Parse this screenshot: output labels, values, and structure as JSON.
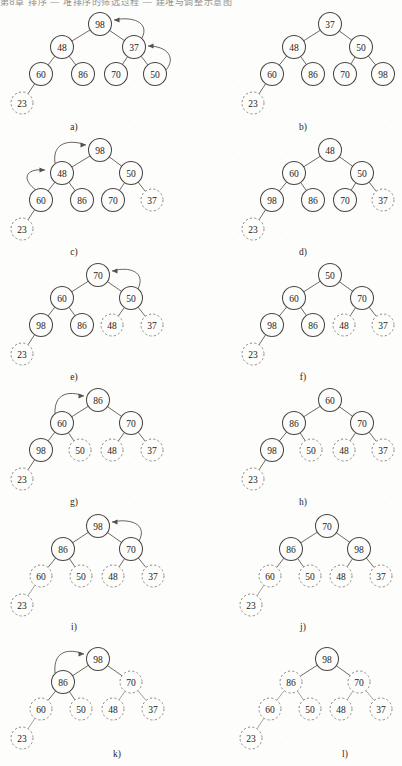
{
  "document": {
    "header_text": "第8章 排序 — 堆排序的筛选过程 — 建堆与调整示意图",
    "figure_type": "binary-tree-diagram-series",
    "node_radius_solid": 11.5,
    "node_radius_dashed": 11,
    "colors": {
      "page_background": "#fdfdfb",
      "solid_node_stroke": "#4a4744",
      "dashed_node_stroke": "#8d8a86",
      "edge_stroke": "#5d5a56",
      "arrow_stroke": "#55524e",
      "text": "#1d1a17"
    }
  },
  "panels": [
    {
      "id": "a",
      "caption": "a)",
      "root": "98",
      "nodes": [
        {
          "label": "98",
          "x": 100,
          "y": 24,
          "style": "solid"
        },
        {
          "label": "48",
          "x": 62,
          "y": 47,
          "style": "solid"
        },
        {
          "label": "37",
          "x": 134,
          "y": 47,
          "style": "solid"
        },
        {
          "label": "60",
          "x": 41,
          "y": 74,
          "style": "solid"
        },
        {
          "label": "86",
          "x": 83,
          "y": 74,
          "style": "solid"
        },
        {
          "label": "70",
          "x": 116,
          "y": 74,
          "style": "solid"
        },
        {
          "label": "50",
          "x": 155,
          "y": 74,
          "style": "solid"
        },
        {
          "label": "23",
          "x": 22,
          "y": 103,
          "style": "dashed"
        }
      ],
      "edges": [
        [
          0,
          1
        ],
        [
          0,
          2
        ],
        [
          1,
          3
        ],
        [
          1,
          4
        ],
        [
          2,
          5
        ],
        [
          2,
          6
        ],
        [
          3,
          7
        ]
      ],
      "arrows": [
        {
          "from": "50",
          "to": "37",
          "path": "M 166 70 C 176 58 168 46 148 46",
          "tip": [
            148,
            46
          ],
          "tip_dir": "left"
        },
        {
          "from": "37",
          "to": "98",
          "path": "M 142 38 C 150 22 132 16 114 20",
          "tip": [
            114,
            20
          ],
          "tip_dir": "left"
        }
      ]
    },
    {
      "id": "b",
      "caption": "b)",
      "root": "37",
      "nodes": [
        {
          "label": "37",
          "x": 330,
          "y": 24,
          "style": "solid"
        },
        {
          "label": "48",
          "x": 294,
          "y": 47,
          "style": "solid"
        },
        {
          "label": "50",
          "x": 361,
          "y": 47,
          "style": "solid"
        },
        {
          "label": "60",
          "x": 272,
          "y": 74,
          "style": "solid"
        },
        {
          "label": "86",
          "x": 313,
          "y": 74,
          "style": "solid"
        },
        {
          "label": "70",
          "x": 345,
          "y": 74,
          "style": "solid"
        },
        {
          "label": "98",
          "x": 383,
          "y": 74,
          "style": "solid"
        },
        {
          "label": "23",
          "x": 253,
          "y": 103,
          "style": "dashed"
        }
      ],
      "edges": [
        [
          0,
          1
        ],
        [
          0,
          2
        ],
        [
          1,
          3
        ],
        [
          1,
          4
        ],
        [
          2,
          5
        ],
        [
          2,
          6
        ],
        [
          3,
          7
        ]
      ],
      "arrows": []
    },
    {
      "id": "c",
      "caption": "c)",
      "root": "98",
      "nodes": [
        {
          "label": "98",
          "x": 100,
          "y": 150,
          "style": "solid"
        },
        {
          "label": "48",
          "x": 62,
          "y": 173,
          "style": "solid"
        },
        {
          "label": "50",
          "x": 131,
          "y": 173,
          "style": "solid"
        },
        {
          "label": "60",
          "x": 41,
          "y": 200,
          "style": "solid"
        },
        {
          "label": "86",
          "x": 82,
          "y": 200,
          "style": "solid"
        },
        {
          "label": "70",
          "x": 113,
          "y": 200,
          "style": "solid"
        },
        {
          "label": "37",
          "x": 152,
          "y": 200,
          "style": "dashed"
        },
        {
          "label": "23",
          "x": 22,
          "y": 229,
          "style": "dashed"
        }
      ],
      "edges": [
        [
          0,
          1
        ],
        [
          0,
          2
        ],
        [
          1,
          3
        ],
        [
          1,
          4
        ],
        [
          2,
          5
        ],
        [
          2,
          6
        ],
        [
          3,
          7
        ]
      ],
      "arrows": [
        {
          "from": "60",
          "to": "48",
          "path": "M 36 190 C 22 180 24 168 45 170",
          "tip": [
            45,
            170
          ],
          "tip_dir": "right"
        },
        {
          "from": "48",
          "to": "98",
          "path": "M 55 163 C 52 142 70 139 86 145",
          "tip": [
            86,
            145
          ],
          "tip_dir": "right"
        }
      ]
    },
    {
      "id": "d",
      "caption": "d)",
      "root": "48",
      "nodes": [
        {
          "label": "48",
          "x": 330,
          "y": 150,
          "style": "solid"
        },
        {
          "label": "60",
          "x": 294,
          "y": 173,
          "style": "solid"
        },
        {
          "label": "50",
          "x": 362,
          "y": 173,
          "style": "solid"
        },
        {
          "label": "98",
          "x": 272,
          "y": 200,
          "style": "solid"
        },
        {
          "label": "86",
          "x": 313,
          "y": 200,
          "style": "solid"
        },
        {
          "label": "70",
          "x": 345,
          "y": 200,
          "style": "solid"
        },
        {
          "label": "37",
          "x": 383,
          "y": 200,
          "style": "dashed"
        },
        {
          "label": "23",
          "x": 253,
          "y": 229,
          "style": "dashed"
        }
      ],
      "edges": [
        [
          0,
          1
        ],
        [
          0,
          2
        ],
        [
          1,
          3
        ],
        [
          1,
          4
        ],
        [
          2,
          5
        ],
        [
          2,
          6
        ],
        [
          3,
          7
        ]
      ],
      "arrows": []
    },
    {
      "id": "e",
      "caption": "e)",
      "root": "70",
      "nodes": [
        {
          "label": "70",
          "x": 98,
          "y": 275,
          "style": "solid"
        },
        {
          "label": "60",
          "x": 62,
          "y": 298,
          "style": "solid"
        },
        {
          "label": "50",
          "x": 131,
          "y": 298,
          "style": "solid"
        },
        {
          "label": "98",
          "x": 41,
          "y": 325,
          "style": "solid"
        },
        {
          "label": "86",
          "x": 82,
          "y": 325,
          "style": "solid"
        },
        {
          "label": "48",
          "x": 112,
          "y": 325,
          "style": "dashed"
        },
        {
          "label": "37",
          "x": 152,
          "y": 325,
          "style": "dashed"
        },
        {
          "label": "23",
          "x": 22,
          "y": 354,
          "style": "dashed"
        }
      ],
      "edges": [
        [
          0,
          1
        ],
        [
          0,
          2
        ],
        [
          1,
          3
        ],
        [
          1,
          4
        ],
        [
          2,
          5
        ],
        [
          2,
          6
        ],
        [
          3,
          7
        ]
      ],
      "arrows": [
        {
          "from": "50",
          "to": "70",
          "path": "M 138 289 C 146 272 130 266 112 271",
          "tip": [
            112,
            271
          ],
          "tip_dir": "left"
        }
      ]
    },
    {
      "id": "f",
      "caption": "f)",
      "root": "50",
      "nodes": [
        {
          "label": "50",
          "x": 330,
          "y": 275,
          "style": "solid"
        },
        {
          "label": "60",
          "x": 294,
          "y": 298,
          "style": "solid"
        },
        {
          "label": "70",
          "x": 362,
          "y": 298,
          "style": "solid"
        },
        {
          "label": "98",
          "x": 272,
          "y": 325,
          "style": "solid"
        },
        {
          "label": "86",
          "x": 313,
          "y": 325,
          "style": "solid"
        },
        {
          "label": "48",
          "x": 344,
          "y": 325,
          "style": "dashed"
        },
        {
          "label": "37",
          "x": 383,
          "y": 325,
          "style": "dashed"
        },
        {
          "label": "23",
          "x": 253,
          "y": 354,
          "style": "dashed"
        }
      ],
      "edges": [
        [
          0,
          1
        ],
        [
          0,
          2
        ],
        [
          1,
          3
        ],
        [
          1,
          4
        ],
        [
          2,
          5
        ],
        [
          2,
          6
        ],
        [
          3,
          7
        ]
      ],
      "arrows": []
    },
    {
      "id": "g",
      "caption": "g)",
      "root": "86",
      "nodes": [
        {
          "label": "86",
          "x": 98,
          "y": 400,
          "style": "solid"
        },
        {
          "label": "60",
          "x": 62,
          "y": 423,
          "style": "solid"
        },
        {
          "label": "70",
          "x": 131,
          "y": 423,
          "style": "solid"
        },
        {
          "label": "98",
          "x": 41,
          "y": 450,
          "style": "solid"
        },
        {
          "label": "50",
          "x": 80,
          "y": 450,
          "style": "dashed"
        },
        {
          "label": "48",
          "x": 112,
          "y": 450,
          "style": "dashed"
        },
        {
          "label": "37",
          "x": 152,
          "y": 450,
          "style": "dashed"
        },
        {
          "label": "23",
          "x": 22,
          "y": 479,
          "style": "dashed"
        }
      ],
      "edges": [
        [
          0,
          1
        ],
        [
          0,
          2
        ],
        [
          1,
          3
        ],
        [
          1,
          4
        ],
        [
          2,
          5
        ],
        [
          2,
          6
        ],
        [
          3,
          7
        ]
      ],
      "arrows": [
        {
          "from": "60",
          "to": "86",
          "path": "M 55 414 C 54 394 68 390 84 396",
          "tip": [
            84,
            396
          ],
          "tip_dir": "right"
        }
      ]
    },
    {
      "id": "h",
      "caption": "h)",
      "root": "60",
      "nodes": [
        {
          "label": "60",
          "x": 330,
          "y": 400,
          "style": "solid"
        },
        {
          "label": "86",
          "x": 294,
          "y": 423,
          "style": "solid"
        },
        {
          "label": "70",
          "x": 362,
          "y": 423,
          "style": "solid"
        },
        {
          "label": "98",
          "x": 272,
          "y": 450,
          "style": "solid"
        },
        {
          "label": "50",
          "x": 311,
          "y": 450,
          "style": "dashed"
        },
        {
          "label": "48",
          "x": 344,
          "y": 450,
          "style": "dashed"
        },
        {
          "label": "37",
          "x": 383,
          "y": 450,
          "style": "dashed"
        },
        {
          "label": "23",
          "x": 253,
          "y": 479,
          "style": "dashed"
        }
      ],
      "edges": [
        [
          0,
          1
        ],
        [
          0,
          2
        ],
        [
          1,
          3
        ],
        [
          1,
          4
        ],
        [
          2,
          5
        ],
        [
          2,
          6
        ],
        [
          3,
          7
        ]
      ],
      "arrows": []
    },
    {
      "id": "i",
      "caption": "i)",
      "root": "98",
      "nodes": [
        {
          "label": "98",
          "x": 98,
          "y": 526,
          "style": "solid"
        },
        {
          "label": "86",
          "x": 63,
          "y": 549,
          "style": "solid"
        },
        {
          "label": "70",
          "x": 131,
          "y": 549,
          "style": "solid"
        },
        {
          "label": "60",
          "x": 41,
          "y": 576,
          "style": "dashed"
        },
        {
          "label": "50",
          "x": 81,
          "y": 576,
          "style": "dashed"
        },
        {
          "label": "48",
          "x": 113,
          "y": 576,
          "style": "dashed"
        },
        {
          "label": "37",
          "x": 153,
          "y": 576,
          "style": "dashed"
        },
        {
          "label": "23",
          "x": 22,
          "y": 605,
          "style": "dashed"
        }
      ],
      "edges": [
        [
          0,
          1
        ],
        [
          0,
          2
        ],
        [
          1,
          3
        ],
        [
          1,
          4
        ],
        [
          2,
          5
        ],
        [
          2,
          6
        ],
        [
          3,
          7
        ]
      ],
      "arrows": [
        {
          "from": "70",
          "to": "98",
          "path": "M 139 541 C 148 524 130 518 112 522",
          "tip": [
            112,
            522
          ],
          "tip_dir": "left"
        }
      ]
    },
    {
      "id": "j",
      "caption": "j)",
      "root": "70",
      "nodes": [
        {
          "label": "70",
          "x": 327,
          "y": 526,
          "style": "solid"
        },
        {
          "label": "86",
          "x": 291,
          "y": 549,
          "style": "solid"
        },
        {
          "label": "98",
          "x": 359,
          "y": 549,
          "style": "solid"
        },
        {
          "label": "60",
          "x": 270,
          "y": 576,
          "style": "dashed"
        },
        {
          "label": "50",
          "x": 310,
          "y": 576,
          "style": "dashed"
        },
        {
          "label": "48",
          "x": 341,
          "y": 576,
          "style": "dashed"
        },
        {
          "label": "37",
          "x": 381,
          "y": 576,
          "style": "dashed"
        },
        {
          "label": "23",
          "x": 251,
          "y": 605,
          "style": "dashed"
        }
      ],
      "edges": [
        [
          0,
          1
        ],
        [
          0,
          2
        ],
        [
          1,
          3
        ],
        [
          1,
          4
        ],
        [
          2,
          5
        ],
        [
          2,
          6
        ],
        [
          3,
          7
        ]
      ],
      "arrows": []
    },
    {
      "id": "k",
      "caption": "k)",
      "root": "98",
      "nodes": [
        {
          "label": "98",
          "x": 98,
          "y": 659,
          "style": "solid"
        },
        {
          "label": "86",
          "x": 63,
          "y": 682,
          "style": "solid"
        },
        {
          "label": "70",
          "x": 131,
          "y": 682,
          "style": "dashed"
        },
        {
          "label": "60",
          "x": 41,
          "y": 709,
          "style": "dashed"
        },
        {
          "label": "50",
          "x": 81,
          "y": 709,
          "style": "dashed"
        },
        {
          "label": "48",
          "x": 113,
          "y": 709,
          "style": "dashed"
        },
        {
          "label": "37",
          "x": 153,
          "y": 709,
          "style": "dashed"
        },
        {
          "label": "23",
          "x": 22,
          "y": 738,
          "style": "dashed"
        }
      ],
      "edges": [
        [
          0,
          1
        ],
        [
          0,
          2
        ],
        [
          1,
          3
        ],
        [
          1,
          4
        ],
        [
          2,
          5
        ],
        [
          2,
          6
        ],
        [
          3,
          7
        ]
      ],
      "arrows": [
        {
          "from": "86",
          "to": "98",
          "path": "M 55 673 C 53 651 68 648 84 654",
          "tip": [
            84,
            654
          ],
          "tip_dir": "right"
        }
      ]
    },
    {
      "id": "l",
      "caption": "l)",
      "root": "98",
      "nodes": [
        {
          "label": "98",
          "x": 327,
          "y": 659,
          "style": "solid"
        },
        {
          "label": "86",
          "x": 291,
          "y": 682,
          "style": "dashed"
        },
        {
          "label": "70",
          "x": 359,
          "y": 682,
          "style": "dashed"
        },
        {
          "label": "60",
          "x": 270,
          "y": 709,
          "style": "dashed"
        },
        {
          "label": "50",
          "x": 310,
          "y": 709,
          "style": "dashed"
        },
        {
          "label": "48",
          "x": 341,
          "y": 709,
          "style": "dashed"
        },
        {
          "label": "37",
          "x": 381,
          "y": 709,
          "style": "dashed"
        },
        {
          "label": "23",
          "x": 251,
          "y": 738,
          "style": "dashed"
        }
      ],
      "edges": [
        [
          0,
          1
        ],
        [
          0,
          2
        ],
        [
          1,
          3
        ],
        [
          1,
          4
        ],
        [
          2,
          5
        ],
        [
          2,
          6
        ],
        [
          3,
          7
        ]
      ],
      "arrows": []
    }
  ],
  "captions": [
    {
      "id": "a",
      "text": "a)",
      "x": 74,
      "y": 122
    },
    {
      "id": "b",
      "text": "b)",
      "x": 303,
      "y": 122
    },
    {
      "id": "c",
      "text": "c)",
      "x": 74,
      "y": 247
    },
    {
      "id": "d",
      "text": "d)",
      "x": 303,
      "y": 247
    },
    {
      "id": "e",
      "text": "e)",
      "x": 74,
      "y": 372
    },
    {
      "id": "f",
      "text": "f)",
      "x": 303,
      "y": 372
    },
    {
      "id": "g",
      "text": "g)",
      "x": 74,
      "y": 497
    },
    {
      "id": "h",
      "text": "h)",
      "x": 303,
      "y": 497
    },
    {
      "id": "i",
      "text": "i)",
      "x": 74,
      "y": 622
    },
    {
      "id": "j",
      "text": "j)",
      "x": 303,
      "y": 622
    },
    {
      "id": "k",
      "text": "k)",
      "x": 117,
      "y": 749
    },
    {
      "id": "l",
      "text": "l)",
      "x": 345,
      "y": 749
    }
  ]
}
